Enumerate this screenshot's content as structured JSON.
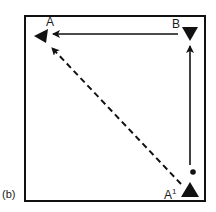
{
  "figure": {
    "panel_label": "(b)",
    "points": {
      "A": {
        "label": "A",
        "marker": "triangle-left"
      },
      "B": {
        "label": "B",
        "marker": "triangle-down"
      },
      "A1": {
        "label": "A",
        "superscript": "1",
        "marker": "triangle-up"
      }
    },
    "paths": [
      {
        "from": "A1",
        "to": "B",
        "style": "solid"
      },
      {
        "from": "B",
        "to": "A",
        "style": "solid"
      },
      {
        "from": "A1",
        "to": "A",
        "style": "dashed"
      }
    ],
    "colors": {
      "ink": "#111111",
      "background": "#ffffff"
    }
  }
}
